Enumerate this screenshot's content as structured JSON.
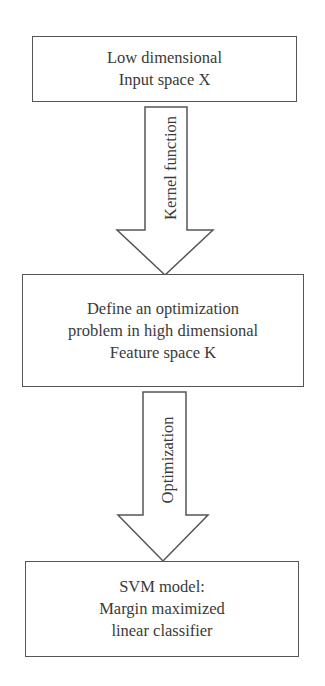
{
  "diagram": {
    "type": "flowchart",
    "direction": "top-to-bottom",
    "nodes": [
      {
        "id": "input",
        "lines": [
          "Low dimensional",
          "Input space X"
        ]
      },
      {
        "id": "feature",
        "lines": [
          "Define an optimization",
          "problem in high dimensional",
          "Feature space K"
        ]
      },
      {
        "id": "svm",
        "lines": [
          "SVM model:",
          "Margin maximized",
          "linear classifier"
        ]
      }
    ],
    "edges": [
      {
        "from": "input",
        "to": "feature",
        "label": "Kernel function"
      },
      {
        "from": "feature",
        "to": "svm",
        "label": "Optimization"
      }
    ],
    "colors": {
      "stroke": "#555555",
      "text": "#3a3a3a",
      "background": "#ffffff"
    }
  }
}
